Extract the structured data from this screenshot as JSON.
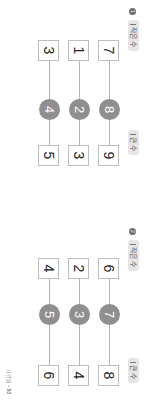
{
  "labels": {
    "small": "작은 수",
    "large": "큰 수"
  },
  "problems": [
    {
      "number": "1",
      "rows": [
        {
          "small": "7",
          "middle": "8",
          "large": "9"
        },
        {
          "small": "1",
          "middle": "2",
          "large": "3"
        },
        {
          "small": "3",
          "middle": "4",
          "large": "5"
        }
      ]
    },
    {
      "number": "2",
      "rows": [
        {
          "small": "6",
          "middle": "7",
          "large": "8"
        },
        {
          "small": "2",
          "middle": "3",
          "large": "4"
        },
        {
          "small": "4",
          "middle": "5",
          "large": "6"
        }
      ]
    }
  ],
  "footer": {
    "section": "시간원",
    "separator": "•",
    "page": "53"
  },
  "colors": {
    "circle": "#8f8f8f",
    "pill": "#e6e6e6",
    "box_border": "#bdbdbd",
    "line": "#b5b5b5"
  }
}
